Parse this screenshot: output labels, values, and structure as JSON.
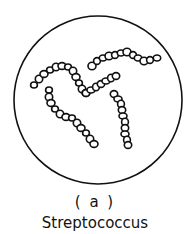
{
  "figure": {
    "sublabel": "( a )",
    "caption": "Streptococcus",
    "stroke_color": "#111111",
    "background": "#ffffff",
    "circle": {
      "cx": 98,
      "cy": 100,
      "r": 84
    },
    "chains": [
      [
        [
          34,
          85
        ],
        [
          39,
          79
        ],
        [
          44,
          74
        ],
        [
          50,
          70
        ],
        [
          56,
          67
        ],
        [
          62,
          66
        ],
        [
          68,
          67
        ],
        [
          73,
          71
        ],
        [
          76,
          77
        ],
        [
          79,
          83
        ],
        [
          82,
          89
        ],
        [
          86,
          93
        ]
      ],
      [
        [
          86,
          93
        ],
        [
          91,
          90
        ],
        [
          96,
          87
        ],
        [
          101,
          84
        ],
        [
          106,
          81
        ],
        [
          111,
          78
        ],
        [
          116,
          76
        ]
      ],
      [
        [
          92,
          66
        ],
        [
          97,
          61
        ],
        [
          103,
          58
        ],
        [
          109,
          56
        ],
        [
          115,
          55
        ],
        [
          121,
          53
        ],
        [
          127,
          52
        ],
        [
          133,
          55
        ],
        [
          138,
          58
        ],
        [
          144,
          61
        ],
        [
          150,
          60
        ],
        [
          157,
          58
        ]
      ],
      [
        [
          49,
          90
        ],
        [
          49,
          97
        ],
        [
          51,
          103
        ],
        [
          55,
          109
        ],
        [
          60,
          114
        ],
        [
          66,
          117
        ],
        [
          72,
          118
        ],
        [
          77,
          123
        ],
        [
          81,
          128
        ],
        [
          86,
          133
        ],
        [
          90,
          139
        ],
        [
          94,
          144
        ]
      ],
      [
        [
          114,
          94
        ],
        [
          118,
          99
        ],
        [
          121,
          104
        ],
        [
          122,
          110
        ],
        [
          123,
          116
        ],
        [
          125,
          122
        ],
        [
          125,
          128
        ],
        [
          125,
          134
        ],
        [
          127,
          140
        ],
        [
          128,
          145
        ]
      ]
    ]
  }
}
